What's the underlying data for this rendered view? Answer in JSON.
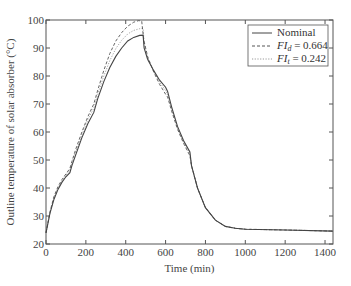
{
  "chart_data": {
    "type": "line",
    "title": "",
    "xlabel": "Time (min)",
    "ylabel": "Outline temperature of solar absorber (°C)",
    "xlim": [
      0,
      1440
    ],
    "ylim": [
      20,
      100
    ],
    "xticks": [
      0,
      200,
      400,
      600,
      800,
      1000,
      1200,
      1400
    ],
    "yticks": [
      20,
      30,
      40,
      50,
      60,
      70,
      80,
      90,
      100
    ],
    "grid": false,
    "legend_position": "upper right",
    "series": [
      {
        "name": "Nominal",
        "legend_main": "Nominal",
        "legend_sub": "",
        "legend_value": "",
        "style": "solid",
        "color": "#444444",
        "points": [
          [
            0,
            24
          ],
          [
            20,
            31
          ],
          [
            40,
            36
          ],
          [
            60,
            39.5
          ],
          [
            80,
            42
          ],
          [
            100,
            44
          ],
          [
            120,
            45.5
          ],
          [
            130,
            48
          ],
          [
            150,
            52
          ],
          [
            180,
            58
          ],
          [
            210,
            63
          ],
          [
            240,
            67
          ],
          [
            250,
            69.5
          ],
          [
            260,
            72
          ],
          [
            290,
            78
          ],
          [
            320,
            83
          ],
          [
            350,
            87
          ],
          [
            380,
            90
          ],
          [
            410,
            92.5
          ],
          [
            440,
            93.8
          ],
          [
            470,
            94.5
          ],
          [
            487,
            94.6
          ],
          [
            492,
            90
          ],
          [
            510,
            86
          ],
          [
            540,
            82
          ],
          [
            570,
            78.5
          ],
          [
            600,
            76
          ],
          [
            610,
            74.5
          ],
          [
            630,
            69
          ],
          [
            660,
            62
          ],
          [
            690,
            57
          ],
          [
            722,
            52.9
          ],
          [
            730,
            48
          ],
          [
            760,
            40
          ],
          [
            800,
            33
          ],
          [
            850,
            28.5
          ],
          [
            900,
            26.3
          ],
          [
            950,
            25.6
          ],
          [
            1000,
            25.3
          ],
          [
            1200,
            25
          ],
          [
            1440,
            24.6
          ]
        ]
      },
      {
        "name": "FI_d = 0.664",
        "legend_main": "FI",
        "legend_sub": "d",
        "legend_value": " = 0.664",
        "style": "dashed",
        "color": "#555555",
        "points": [
          [
            0,
            24
          ],
          [
            20,
            31.5
          ],
          [
            40,
            37
          ],
          [
            60,
            40.5
          ],
          [
            80,
            43
          ],
          [
            100,
            45
          ],
          [
            120,
            47
          ],
          [
            130,
            49.5
          ],
          [
            150,
            54
          ],
          [
            180,
            60
          ],
          [
            210,
            65.5
          ],
          [
            240,
            70
          ],
          [
            250,
            72.5
          ],
          [
            260,
            75
          ],
          [
            290,
            82
          ],
          [
            320,
            88
          ],
          [
            350,
            92.5
          ],
          [
            380,
            95.5
          ],
          [
            410,
            97.8
          ],
          [
            440,
            99.2
          ],
          [
            465,
            99.8
          ],
          [
            480,
            99.6
          ],
          [
            490,
            93
          ],
          [
            510,
            87
          ],
          [
            540,
            81.5
          ],
          [
            570,
            77
          ],
          [
            600,
            73.5
          ],
          [
            610,
            72.5
          ],
          [
            630,
            67.5
          ],
          [
            660,
            61
          ],
          [
            690,
            56
          ],
          [
            722,
            51.5
          ],
          [
            730,
            48
          ],
          [
            760,
            40
          ],
          [
            800,
            33
          ],
          [
            850,
            28.5
          ],
          [
            900,
            26.3
          ],
          [
            950,
            25.6
          ],
          [
            1000,
            25.3
          ],
          [
            1200,
            25
          ],
          [
            1440,
            24.6
          ]
        ]
      },
      {
        "name": "FI_t = 0.242",
        "legend_main": "FI",
        "legend_sub": "t",
        "legend_value": " = 0.242",
        "style": "dotted",
        "color": "#999999",
        "points": [
          [
            0,
            24
          ],
          [
            20,
            31.2
          ],
          [
            40,
            36.5
          ],
          [
            60,
            40
          ],
          [
            80,
            42.5
          ],
          [
            100,
            44.5
          ],
          [
            120,
            46.5
          ],
          [
            130,
            49
          ],
          [
            150,
            53
          ],
          [
            180,
            59
          ],
          [
            210,
            64.5
          ],
          [
            240,
            68.5
          ],
          [
            250,
            71
          ],
          [
            260,
            73.5
          ],
          [
            290,
            80
          ],
          [
            320,
            85.5
          ],
          [
            350,
            89.8
          ],
          [
            380,
            92.8
          ],
          [
            410,
            95
          ],
          [
            440,
            96.3
          ],
          [
            470,
            96.9
          ],
          [
            487,
            97
          ],
          [
            492,
            92
          ],
          [
            510,
            86.5
          ],
          [
            540,
            81.8
          ],
          [
            570,
            77.8
          ],
          [
            600,
            74.8
          ],
          [
            610,
            73.5
          ],
          [
            630,
            68.3
          ],
          [
            660,
            61.5
          ],
          [
            690,
            56.5
          ],
          [
            722,
            52.2
          ],
          [
            730,
            48
          ],
          [
            760,
            40
          ],
          [
            800,
            33
          ],
          [
            850,
            28.5
          ],
          [
            900,
            26.3
          ],
          [
            950,
            25.6
          ],
          [
            1000,
            25.3
          ],
          [
            1200,
            25
          ],
          [
            1440,
            24.6
          ]
        ]
      }
    ]
  },
  "axes": {
    "xlabel": "Time (min)",
    "ylabel": "Outline temperature of solar absorber (°C)",
    "xtick_labels": [
      "0",
      "200",
      "400",
      "600",
      "800",
      "1000",
      "1200",
      "1400"
    ],
    "ytick_labels": [
      "20",
      "30",
      "40",
      "50",
      "60",
      "70",
      "80",
      "90",
      "100"
    ]
  },
  "legend": {
    "items": [
      {
        "main": "Nominal",
        "sub": "",
        "value": ""
      },
      {
        "main": "FI",
        "sub": "d",
        "value": " = 0.664"
      },
      {
        "main": "FI",
        "sub": "t",
        "value": " = 0.242"
      }
    ]
  }
}
